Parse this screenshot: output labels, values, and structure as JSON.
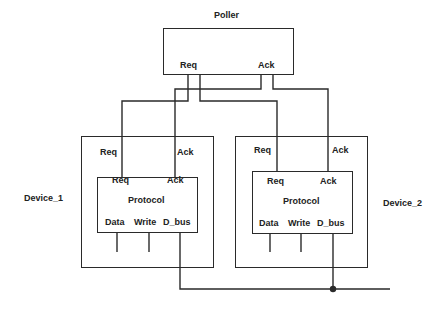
{
  "poller": {
    "title": "Poller",
    "ports": {
      "req": "Req",
      "ack": "Ack"
    }
  },
  "devices": [
    {
      "name": "Device_1",
      "outer_ports": {
        "req": "Req",
        "ack": "Ack"
      },
      "protocol": {
        "title": "Protocol",
        "ports": {
          "req": "Req",
          "ack": "Ack",
          "data": "Data",
          "write": "Write",
          "d_bus": "D_bus"
        }
      }
    },
    {
      "name": "Device_2",
      "outer_ports": {
        "req": "Req",
        "ack": "Ack"
      },
      "protocol": {
        "title": "Protocol",
        "ports": {
          "req": "Req",
          "ack": "Ack",
          "data": "Data",
          "write": "Write",
          "d_bus": "D_bus"
        }
      }
    }
  ],
  "colors": {
    "stroke": "#2a2a2a",
    "text": "#222222",
    "background": "#ffffff"
  }
}
